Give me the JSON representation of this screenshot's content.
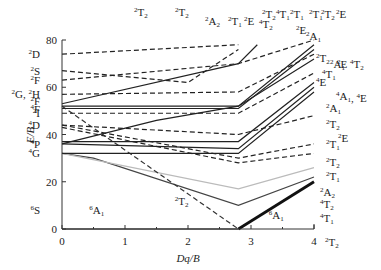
{
  "chart_data": {
    "type": "line",
    "title": "",
    "xlabel": "Dq/B",
    "ylabel": "E/B",
    "xlim": [
      0,
      4
    ],
    "ylim": [
      0,
      80
    ],
    "x_ticks": [
      "0",
      "1",
      "2",
      "3",
      "4"
    ],
    "y_ticks": [
      "0",
      "20",
      "40",
      "60",
      "80"
    ],
    "grid": false,
    "critical_x": 2.8,
    "free_ion_terms_left": [
      "6S",
      "4G",
      "4P",
      "4D",
      "2I",
      "4F",
      "2F",
      "2G, 2H",
      "2F",
      "2S",
      "2D"
    ],
    "term_labels_left": [
      {
        "text": "2D",
        "y": 74
      },
      {
        "text": "2S",
        "y": 67
      },
      {
        "text": "2F",
        "y": 63
      },
      {
        "text": "2G, 2H",
        "y": 57
      },
      {
        "text": "2F",
        "y": 54
      },
      {
        "text": "4F",
        "y": 51
      },
      {
        "text": "2I",
        "y": 49
      },
      {
        "text": "4D",
        "y": 44
      },
      {
        "text": "4P",
        "y": 36
      },
      {
        "text": "4G",
        "y": 32
      },
      {
        "text": "6S",
        "y": 8
      }
    ],
    "top_labels": [
      "2T2",
      "2T2",
      "2A2",
      "2T1",
      "2E",
      "4T2",
      "2T2",
      "4T1",
      "2T1",
      "2T1",
      "2T2",
      "2E",
      "2E",
      "2A1"
    ],
    "right_labels": [
      "2T2",
      "4T1",
      "2A1",
      "2E",
      "4T2",
      "4E",
      "4A1, 4E",
      "2A1",
      "2T2",
      "2T1",
      "2E",
      "2T2",
      "2T1",
      "2A2",
      "4T2",
      "4T1",
      "2T2"
    ],
    "inline_labels": [
      {
        "text": "6A1",
        "x": 0.55,
        "y": 8
      },
      {
        "text": "2T2",
        "x": 1.9,
        "y": 12
      },
      {
        "text": "6A1",
        "x": 3.4,
        "y": 6
      }
    ],
    "series": [
      {
        "name": "6A1 (ground, weak field)",
        "style": "solid",
        "color": "#111",
        "width": 1.2,
        "points": [
          [
            0,
            0
          ],
          [
            2.8,
            0
          ]
        ]
      },
      {
        "name": "6A1 (strong field)",
        "style": "solid",
        "color": "#111",
        "width": 2.8,
        "points": [
          [
            2.8,
            0
          ],
          [
            4,
            20
          ]
        ]
      },
      {
        "name": "4T1",
        "style": "solid",
        "color": "#444",
        "width": 1.2,
        "points": [
          [
            0,
            32
          ],
          [
            0.5,
            30
          ],
          [
            2.8,
            10
          ],
          [
            4,
            22
          ]
        ]
      },
      {
        "name": "4T2",
        "style": "solid",
        "color": "#bbb",
        "width": 1.2,
        "points": [
          [
            0,
            32
          ],
          [
            2.8,
            17
          ],
          [
            4,
            26
          ]
        ]
      },
      {
        "name": "2T2 (descending)",
        "style": "dashed",
        "color": "#333",
        "width": 1.2,
        "points": [
          [
            0,
            52
          ],
          [
            2.8,
            0
          ]
        ]
      },
      {
        "name": "4A1,4E",
        "style": "solid",
        "color": "#222",
        "width": 1.2,
        "points": [
          [
            0,
            32
          ],
          [
            2.8,
            32
          ],
          [
            4,
            58
          ]
        ]
      },
      {
        "name": "4T2 (4P)",
        "style": "solid",
        "color": "#222",
        "width": 1.2,
        "points": [
          [
            0,
            36
          ],
          [
            2.8,
            34
          ],
          [
            4,
            60
          ]
        ]
      },
      {
        "name": "4E (4D)",
        "style": "solid",
        "color": "#222",
        "width": 1.2,
        "points": [
          [
            0,
            37
          ],
          [
            2.8,
            37
          ],
          [
            4,
            62
          ]
        ]
      },
      {
        "name": "4T1 (rising)",
        "style": "solid",
        "color": "#222",
        "width": 1.2,
        "points": [
          [
            0,
            36
          ],
          [
            1.5,
            46
          ],
          [
            2.8,
            52
          ],
          [
            4,
            72
          ]
        ]
      },
      {
        "name": "4T2 (4F)",
        "style": "solid",
        "color": "#222",
        "width": 1.2,
        "points": [
          [
            0,
            51
          ],
          [
            2.8,
            51
          ],
          [
            4,
            76
          ]
        ]
      },
      {
        "name": "4T1 (4F)",
        "style": "solid",
        "color": "#222",
        "width": 1.2,
        "points": [
          [
            0,
            52
          ],
          [
            2.8,
            52
          ],
          [
            4,
            78
          ]
        ]
      },
      {
        "name": "4T2 (top)",
        "style": "solid",
        "color": "#222",
        "width": 1.2,
        "points": [
          [
            0,
            53
          ],
          [
            2.8,
            70
          ],
          [
            3.1,
            78
          ]
        ]
      },
      {
        "name": "2D",
        "style": "dashed",
        "color": "#222",
        "width": 1.2,
        "points": [
          [
            0,
            74
          ],
          [
            2.8,
            78
          ]
        ]
      },
      {
        "name": "2S->2A1",
        "style": "dashed",
        "color": "#222",
        "width": 1.2,
        "points": [
          [
            0,
            67
          ],
          [
            2.0,
            62
          ],
          [
            2.8,
            76
          ]
        ]
      },
      {
        "name": "2F group",
        "style": "dashed",
        "color": "#222",
        "width": 1.2,
        "points": [
          [
            0,
            63
          ],
          [
            2.8,
            70
          ],
          [
            4,
            80
          ]
        ]
      },
      {
        "name": "2G,2H group",
        "style": "dashed",
        "color": "#222",
        "width": 1.2,
        "points": [
          [
            0,
            57
          ],
          [
            2.8,
            58
          ],
          [
            4,
            74
          ]
        ]
      },
      {
        "name": "2I group",
        "style": "dashed",
        "color": "#222",
        "width": 1.2,
        "points": [
          [
            0,
            49
          ],
          [
            2.8,
            49
          ],
          [
            4,
            66
          ]
        ]
      },
      {
        "name": "4D group",
        "style": "dashed",
        "color": "#222",
        "width": 1.2,
        "points": [
          [
            0,
            44
          ],
          [
            2.8,
            40
          ],
          [
            4,
            48
          ]
        ]
      },
      {
        "name": "2T1 lower",
        "style": "dashed",
        "color": "#222",
        "width": 1.2,
        "points": [
          [
            0,
            44
          ],
          [
            2.8,
            30
          ],
          [
            4,
            36
          ]
        ]
      },
      {
        "name": "2A2 lower",
        "style": "dashed",
        "color": "#222",
        "width": 1.2,
        "points": [
          [
            0,
            43
          ],
          [
            2.8,
            28
          ],
          [
            4,
            32
          ]
        ]
      }
    ]
  }
}
